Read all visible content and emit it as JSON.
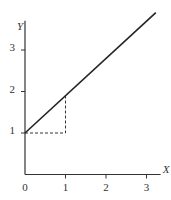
{
  "chart_data": {
    "type": "line",
    "title": "",
    "xlabel": "X",
    "ylabel": "Y",
    "xlim": [
      0,
      3.25
    ],
    "ylim": [
      0,
      3.9
    ],
    "x_ticks": [
      "0",
      "1",
      "2",
      "3"
    ],
    "y_ticks": [
      "1",
      "2",
      "3"
    ],
    "grid": false,
    "legend": "none",
    "series": [
      {
        "name": "line",
        "style": "solid",
        "x": [
          0,
          3.23
        ],
        "y": [
          1,
          3.9
        ]
      }
    ],
    "annotations": [
      {
        "name": "rise-run-triangle",
        "style": "dashed",
        "points": [
          [
            0,
            1
          ],
          [
            1,
            1
          ],
          [
            1,
            1.9
          ]
        ]
      }
    ]
  }
}
